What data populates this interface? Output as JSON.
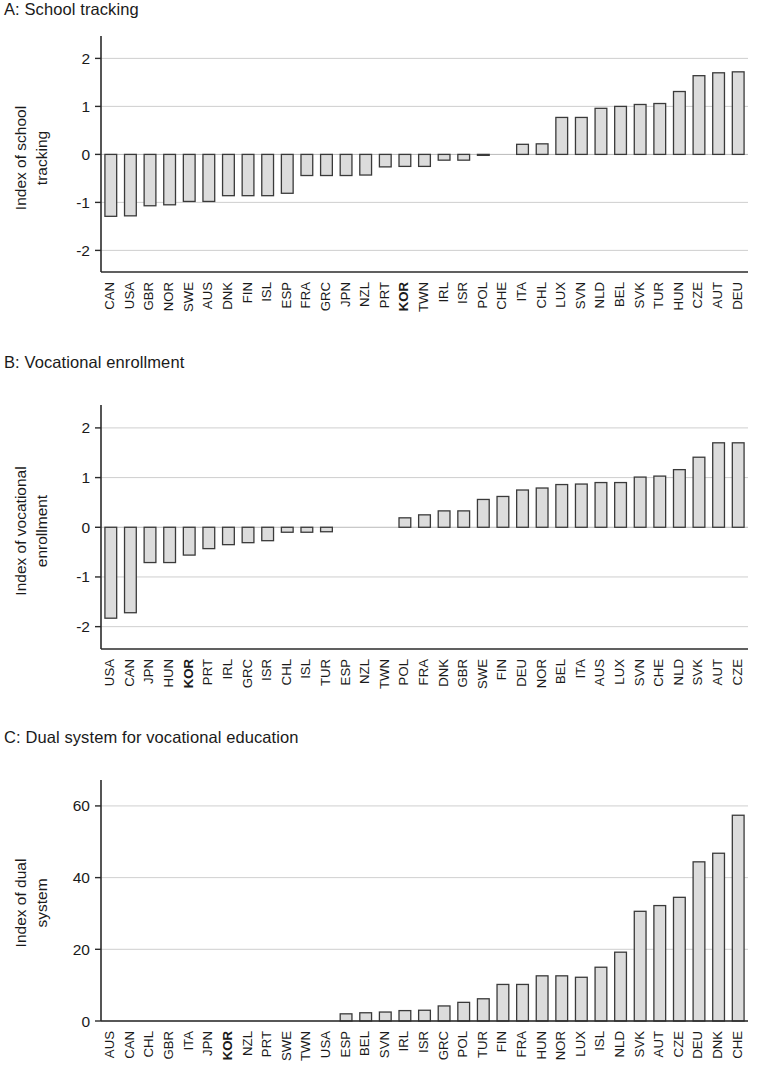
{
  "figure": {
    "title": "",
    "panels": [
      "A",
      "B",
      "C"
    ]
  },
  "panel_a": {
    "title": "A: School tracking",
    "ylabel_line1": "Index of school",
    "ylabel_line2": "tracking"
  },
  "panel_b": {
    "title": "B: Vocational enrollment",
    "ylabel_line1": "Index of vocational",
    "ylabel_line2": "enrollment"
  },
  "panel_c": {
    "title": "C: Dual system for vocational education",
    "ylabel_line1": "Index of dual",
    "ylabel_line2": "system"
  },
  "highlight_country": "KOR",
  "colors": {
    "bar_fill": "#dcdcdc",
    "bar_stroke": "#3a3a3a",
    "grid": "#c9c9c9",
    "axis": "#2b2b2b",
    "text": "#1a1a1a"
  },
  "chart_data": [
    {
      "type": "bar",
      "panel": "A",
      "title": "A: School tracking",
      "xlabel": "",
      "ylabel": "Index of school tracking",
      "ylim": [
        -2.45,
        2.3
      ],
      "yticks": [
        2,
        1,
        0,
        -1,
        -2
      ],
      "ytick_labels": [
        "2",
        "1",
        "0",
        "-1",
        "-2"
      ],
      "grid": true,
      "legend": "none",
      "highlight": [
        "KOR"
      ],
      "categories": [
        "CAN",
        "USA",
        "GBR",
        "NOR",
        "SWE",
        "AUS",
        "DNK",
        "FIN",
        "ISL",
        "ESP",
        "FRA",
        "GRC",
        "JPN",
        "NZL",
        "PRT",
        "KOR",
        "TWN",
        "IRL",
        "ISR",
        "POL",
        "CHE",
        "ITA",
        "CHL",
        "LUX",
        "SVN",
        "NLD",
        "BEL",
        "SVK",
        "TUR",
        "HUN",
        "CZE",
        "AUT",
        "DEU"
      ],
      "values": [
        -1.29,
        -1.28,
        -1.07,
        -1.05,
        -0.98,
        -0.98,
        -0.86,
        -0.86,
        -0.86,
        -0.81,
        -0.44,
        -0.44,
        -0.44,
        -0.43,
        -0.26,
        -0.25,
        -0.25,
        -0.12,
        -0.12,
        -0.02,
        -0.01,
        0.21,
        0.22,
        0.77,
        0.77,
        0.96,
        1.0,
        1.04,
        1.06,
        1.31,
        1.64,
        1.7,
        1.72
      ]
    },
    {
      "type": "bar",
      "panel": "B",
      "title": "B: Vocational enrollment",
      "xlabel": "",
      "ylabel": "Index of vocational enrollment",
      "ylim": [
        -2.45,
        2.3
      ],
      "yticks": [
        2,
        1,
        0,
        -1,
        -2
      ],
      "ytick_labels": [
        "2",
        "1",
        "0",
        "-1",
        "-2"
      ],
      "grid": true,
      "legend": "none",
      "highlight": [
        "KOR"
      ],
      "categories": [
        "USA",
        "CAN",
        "JPN",
        "HUN",
        "KOR",
        "PRT",
        "IRL",
        "GRC",
        "ISR",
        "CHL",
        "ISL",
        "TUR",
        "ESP",
        "NZL",
        "TWN",
        "POL",
        "FRA",
        "DNK",
        "GBR",
        "SWE",
        "FIN",
        "DEU",
        "NOR",
        "BEL",
        "ITA",
        "AUS",
        "LUX",
        "SVN",
        "CHE",
        "NLD",
        "SVK",
        "AUT",
        "CZE"
      ],
      "values": [
        -1.83,
        -1.72,
        -0.71,
        -0.71,
        -0.56,
        -0.43,
        -0.35,
        -0.31,
        -0.27,
        -0.1,
        -0.1,
        -0.09,
        0.0,
        0.0,
        0.0,
        0.19,
        0.25,
        0.33,
        0.33,
        0.56,
        0.62,
        0.75,
        0.79,
        0.86,
        0.87,
        0.9,
        0.9,
        1.01,
        1.03,
        1.16,
        1.41,
        1.7,
        1.7
      ]
    },
    {
      "type": "bar",
      "panel": "C",
      "title": "C: Dual system for vocational education",
      "xlabel": "",
      "ylabel": "Index of dual system",
      "ylim": [
        0,
        65
      ],
      "yticks": [
        0,
        20,
        40,
        60
      ],
      "ytick_labels": [
        "0",
        "20",
        "40",
        "60"
      ],
      "grid": true,
      "legend": "none",
      "highlight": [
        "KOR"
      ],
      "categories": [
        "AUS",
        "CAN",
        "CHL",
        "GBR",
        "ITA",
        "JPN",
        "KOR",
        "NZL",
        "PRT",
        "SWE",
        "TWN",
        "USA",
        "ESP",
        "BEL",
        "SVN",
        "IRL",
        "ISR",
        "GRC",
        "POL",
        "TUR",
        "FIN",
        "FRA",
        "HUN",
        "NOR",
        "LUX",
        "ISL",
        "NLD",
        "SVK",
        "AUT",
        "CZE",
        "DEU",
        "DNK",
        "CHE"
      ],
      "values": [
        0,
        0,
        0,
        0,
        0,
        0,
        0,
        0,
        0,
        0,
        0,
        0,
        2.0,
        2.3,
        2.5,
        2.9,
        3.0,
        4.2,
        5.2,
        6.2,
        10.2,
        10.2,
        12.6,
        12.6,
        12.2,
        15.0,
        19.2,
        30.6,
        32.2,
        34.5,
        44.4,
        46.8,
        57.4
      ]
    }
  ]
}
